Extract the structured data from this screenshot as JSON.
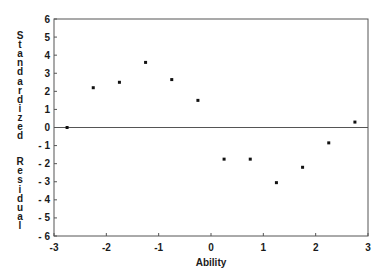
{
  "chart_data": {
    "type": "scatter",
    "title": "",
    "xlabel": "Ability",
    "ylabel": "Standardized Residual",
    "xlim": [
      -3,
      3
    ],
    "ylim": [
      -6,
      6
    ],
    "xticks": [
      -3,
      -2,
      -1,
      0,
      1,
      2,
      3
    ],
    "yticks": [
      6,
      5,
      4,
      3,
      2,
      1,
      0,
      -1,
      -2,
      -3,
      -4,
      -5,
      -6
    ],
    "grid": false,
    "legend": null,
    "reference_line": {
      "y": 0
    },
    "series": [
      {
        "name": "Standardized Residual",
        "x": [
          -2.75,
          -2.25,
          -1.75,
          -1.25,
          -0.75,
          -0.25,
          0.25,
          0.75,
          1.25,
          1.75,
          2.25,
          2.75
        ],
        "y": [
          0.0,
          2.2,
          2.5,
          3.6,
          2.65,
          1.5,
          -1.75,
          -1.75,
          -3.05,
          -2.2,
          -0.85,
          0.3
        ]
      }
    ]
  },
  "colors": {
    "axis": "#555555",
    "points": "#111111",
    "text": "#1a1a1a"
  }
}
